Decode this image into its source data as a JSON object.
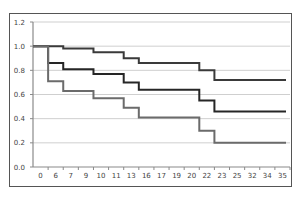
{
  "chart_data": {
    "type": "line",
    "subtype": "step",
    "title": "",
    "xlabel": "",
    "ylabel": "",
    "categories": [
      "0",
      "6",
      "7",
      "9",
      "10",
      "11",
      "13",
      "16",
      "17",
      "19",
      "20",
      "22",
      "23",
      "25",
      "32",
      "34",
      "35"
    ],
    "series": [
      {
        "name": "Series 1",
        "color": "#3a3a3a",
        "values": [
          1.0,
          1.0,
          0.98,
          0.98,
          0.95,
          0.95,
          0.9,
          0.86,
          0.86,
          0.86,
          0.86,
          0.8,
          0.72,
          0.72,
          0.72,
          0.72,
          0.72
        ]
      },
      {
        "name": "Series 2",
        "color": "#262626",
        "values": [
          1.0,
          0.86,
          0.81,
          0.81,
          0.77,
          0.77,
          0.7,
          0.64,
          0.64,
          0.64,
          0.64,
          0.55,
          0.46,
          0.46,
          0.46,
          0.46,
          0.46
        ]
      },
      {
        "name": "Series 3",
        "color": "#6b6b6b",
        "values": [
          1.0,
          0.71,
          0.63,
          0.63,
          0.57,
          0.57,
          0.49,
          0.41,
          0.41,
          0.41,
          0.41,
          0.3,
          0.2,
          0.2,
          0.2,
          0.2,
          0.2
        ]
      }
    ],
    "yticks": [
      "0.0",
      "0.2",
      "0.4",
      "0.6",
      "0.8",
      "1.0",
      "1.2"
    ],
    "ylim": [
      0,
      1.2
    ],
    "grid": true,
    "legend": "none"
  },
  "colors": {
    "gridline": "#cfcfcf",
    "axis": "#8a8a8a",
    "frame": "#555555"
  }
}
